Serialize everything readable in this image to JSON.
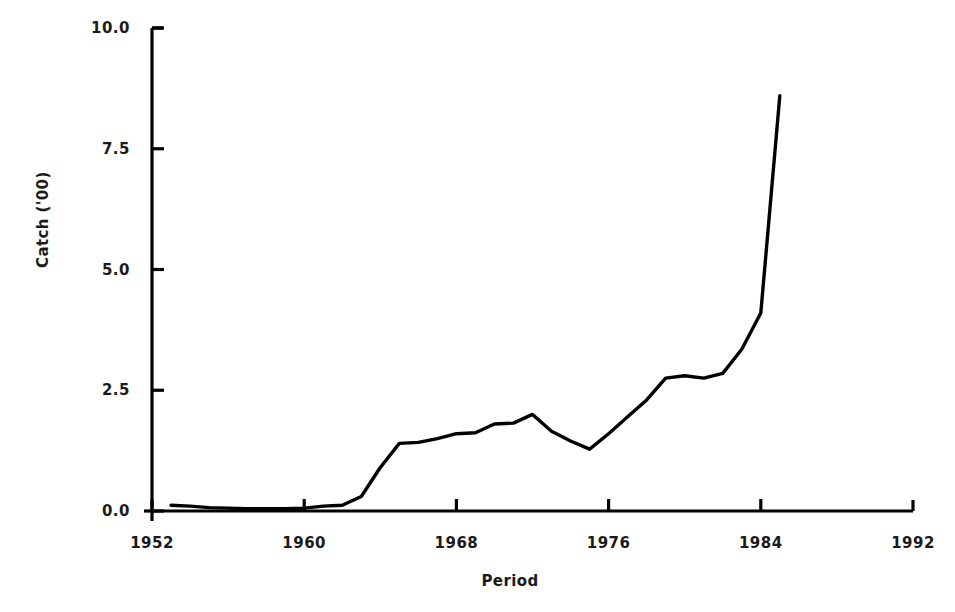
{
  "chart_data": {
    "type": "line",
    "title": "",
    "xlabel": "Period",
    "ylabel": "Catch ('00)",
    "xlim": [
      1952,
      1992
    ],
    "ylim": [
      0.0,
      10.0
    ],
    "grid": false,
    "legend": null,
    "xticks": [
      "1952",
      "1960",
      "1968",
      "1976",
      "1984",
      "1992"
    ],
    "xtick_values": [
      1952,
      1960,
      1968,
      1976,
      1984,
      1992
    ],
    "yticks": [
      "0.0",
      "2.5",
      "5.0",
      "7.5",
      "10.0"
    ],
    "ytick_values": [
      0.0,
      2.5,
      5.0,
      7.5,
      10.0
    ],
    "series": [
      {
        "name": "Catch",
        "color": "#000000",
        "x": [
          1953,
          1954,
          1955,
          1956,
          1957,
          1958,
          1959,
          1960,
          1961,
          1962,
          1963,
          1964,
          1965,
          1966,
          1967,
          1968,
          1969,
          1970,
          1971,
          1972,
          1973,
          1974,
          1975,
          1976,
          1977,
          1978,
          1979,
          1980,
          1981,
          1982,
          1983,
          1984,
          1985
        ],
        "values": [
          0.12,
          0.1,
          0.07,
          0.06,
          0.05,
          0.05,
          0.05,
          0.06,
          0.1,
          0.12,
          0.3,
          0.9,
          1.4,
          1.42,
          1.5,
          1.6,
          1.62,
          1.8,
          1.82,
          2.0,
          1.65,
          1.45,
          1.28,
          1.6,
          1.95,
          2.3,
          2.75,
          2.8,
          2.75,
          2.85,
          3.35,
          4.1,
          8.6
        ]
      }
    ]
  },
  "axes": {
    "y_axis_title": "Catch ('00)",
    "x_axis_title": "Period"
  }
}
